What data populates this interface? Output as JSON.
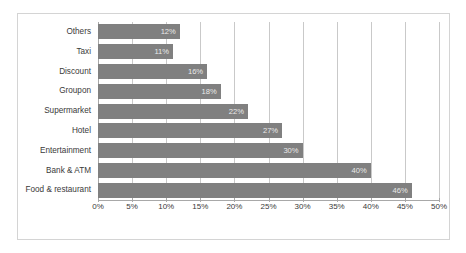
{
  "chart_data": {
    "type": "bar",
    "orientation": "horizontal",
    "title": "",
    "xlabel": "",
    "ylabel": "",
    "categories": [
      "Others",
      "Taxi",
      "Discount",
      "Groupon",
      "Supermarket",
      "Hotel",
      "Entertainment",
      "Bank & ATM",
      "Food & restaurant"
    ],
    "values": [
      12,
      11,
      16,
      18,
      22,
      27,
      30,
      40,
      46
    ],
    "value_labels": [
      "12%",
      "11%",
      "16%",
      "18%",
      "22%",
      "27%",
      "30%",
      "40%",
      "46%"
    ],
    "xlim": [
      0,
      50
    ],
    "xticks": [
      0,
      5,
      10,
      15,
      20,
      25,
      30,
      35,
      40,
      45,
      50
    ],
    "xtick_labels": [
      "0%",
      "5%",
      "10%",
      "15%",
      "20%",
      "25%",
      "30%",
      "35%",
      "40%",
      "45%",
      "50%"
    ],
    "grid": true,
    "grid_axis": "x",
    "legend": false,
    "bar_color": "#808080",
    "value_label_color": "#e9e9e9",
    "gridline_color": "#c9c9c9",
    "axis_color": "#a8a8a8",
    "border_color": "#d4d4d4",
    "background_color": "#ffffff"
  }
}
